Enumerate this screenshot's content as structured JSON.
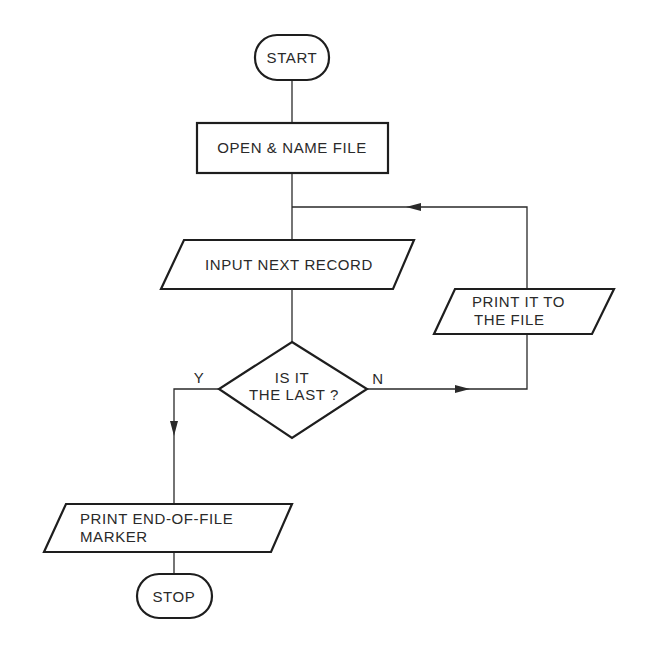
{
  "diagram": {
    "type": "flowchart",
    "colors": {
      "background": "#ffffff",
      "stroke": "#1e1e1e",
      "text": "#2a2a2a"
    },
    "nodes": {
      "start": {
        "shape": "terminator",
        "label": "START"
      },
      "open_file": {
        "shape": "process",
        "label": "OPEN & NAME FILE"
      },
      "input_record": {
        "shape": "io",
        "label": "INPUT NEXT RECORD"
      },
      "decision": {
        "shape": "decision",
        "lines": [
          "IS IT",
          "THE LAST ?"
        ]
      },
      "print_record": {
        "shape": "io",
        "lines": [
          "PRINT IT TO",
          "THE FILE"
        ]
      },
      "print_eof": {
        "shape": "io",
        "lines": [
          "PRINT END-OF-FILE",
          "MARKER"
        ]
      },
      "stop": {
        "shape": "terminator",
        "label": "STOP"
      }
    },
    "branch_labels": {
      "yes": "Y",
      "no": "N"
    },
    "edges": [
      {
        "from": "start",
        "to": "open_file"
      },
      {
        "from": "open_file",
        "to": "input_record"
      },
      {
        "from": "input_record",
        "to": "decision"
      },
      {
        "from": "decision",
        "to": "print_eof",
        "label": "Y"
      },
      {
        "from": "decision",
        "to": "print_record",
        "label": "N"
      },
      {
        "from": "print_record",
        "to": "input_record",
        "note": "loop back"
      },
      {
        "from": "print_eof",
        "to": "stop"
      }
    ]
  }
}
